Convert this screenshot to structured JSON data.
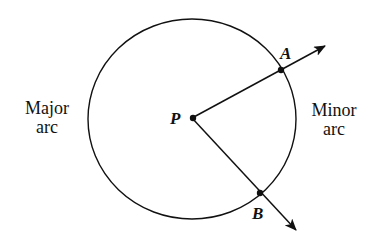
{
  "diagram": {
    "center_label": "P",
    "point_a_label": "A",
    "point_b_label": "B",
    "major_arc_label_line1": "Major",
    "major_arc_label_line2": "arc",
    "minor_arc_label_line1": "Minor",
    "minor_arc_label_line2": "arc",
    "stroke_color": "#111111"
  }
}
